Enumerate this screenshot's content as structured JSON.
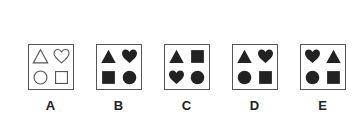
{
  "colors": {
    "outline": "#555555",
    "filled": "#222222",
    "border": "#555555"
  },
  "options": [
    {
      "label": "A",
      "left": 28,
      "style": "outline",
      "shapes": [
        "triangle",
        "heart",
        "circle",
        "square"
      ]
    },
    {
      "label": "B",
      "left": 96,
      "style": "filled",
      "shapes": [
        "triangle",
        "heart",
        "square",
        "circle"
      ]
    },
    {
      "label": "C",
      "left": 164,
      "style": "filled",
      "shapes": [
        "triangle",
        "square",
        "heart",
        "circle"
      ]
    },
    {
      "label": "D",
      "left": 232,
      "style": "filled",
      "shapes": [
        "triangle",
        "heart",
        "circle",
        "square"
      ]
    },
    {
      "label": "E",
      "left": 300,
      "style": "filled",
      "shapes": [
        "heart",
        "triangle",
        "circle",
        "square"
      ]
    }
  ]
}
